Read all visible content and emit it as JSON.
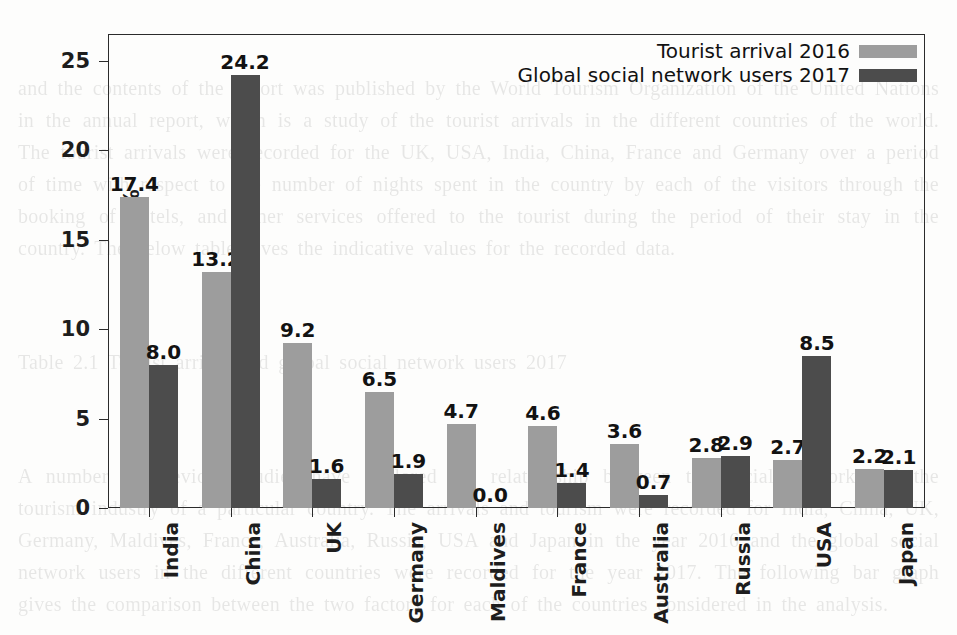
{
  "chart_data": {
    "type": "bar",
    "title": "",
    "xlabel": "",
    "ylabel": "Percentage %",
    "ylim": [
      0,
      26.5
    ],
    "yticks": [
      0,
      5,
      10,
      15,
      20,
      25
    ],
    "ytick_labels": [
      "0",
      "5",
      "10",
      "15",
      "20",
      "25"
    ],
    "grid": false,
    "legend_position": "upper right",
    "categories": [
      "India",
      "China",
      "UK",
      "Germany",
      "Maldives",
      "France",
      "Australia",
      "Russia",
      "USA",
      "Japan"
    ],
    "series": [
      {
        "name": "Tourist arrival 2016",
        "color": "#9d9d9d",
        "values": [
          17.4,
          13.2,
          9.2,
          6.5,
          4.7,
          4.6,
          3.6,
          2.8,
          2.7,
          2.2
        ],
        "value_labels": [
          "17.4",
          "13.2",
          "9.2",
          "6.5",
          "4.7",
          "4.6",
          "3.6",
          "2.8",
          "2.7",
          "2.2"
        ]
      },
      {
        "name": "Global social network users 2017",
        "color": "#4c4c4c",
        "values": [
          8.0,
          24.2,
          1.6,
          1.9,
          0.0,
          1.4,
          0.7,
          2.9,
          8.5,
          2.1
        ],
        "value_labels": [
          "8.0",
          "24.2",
          "1.6",
          "1.9",
          "0.0",
          "1.4",
          "0.7",
          "2.9",
          "8.5",
          "2.1"
        ]
      }
    ]
  },
  "axes": {
    "y_axis_label": "Percentage %"
  },
  "legend": {
    "entries": [
      {
        "label": "Tourist arrival 2016",
        "color": "#9d9d9d"
      },
      {
        "label": "Global social network users 2017",
        "color": "#4c4c4c"
      }
    ]
  },
  "background_text": {
    "blocks": [
      "and the contents of the report was published by the World Tourism Organization of the United Nations in the annual report, which is a study of the tourist arrivals in the different countries of the world. The tourist arrivals were recorded for the UK, USA, India, China, France and Germany over a period of time with respect to the number of nights spent in the country by each of the visitors through the booking of hotels, and other services offered to the tourist during the period of their stay in the country. The below table gives the indicative values for the recorded data.",
      "Table 2.1 Tourist arrival and global social network users 2017",
      "A number of previous studies have explored the relationship between the social network and the tourism industry of a particular country. The arrivals and tourism were recorded for India, China, UK, Germany, Maldives, France, Australia, Russia, USA and Japan in the year 2016 and the global social network users in the different countries were recorded for the year 2017. The following bar graph gives the comparison between the two factors for each of the countries considered in the analysis."
    ]
  }
}
